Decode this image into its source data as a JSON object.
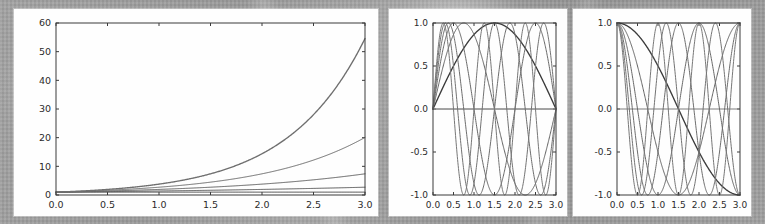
{
  "figure": {
    "title": "",
    "background_color": "#9a9a9a",
    "panel_background": "#fefefe",
    "panel_count": 3
  },
  "panels": [
    {
      "name": "exponential-curves",
      "position": "left"
    },
    {
      "name": "sine-curves",
      "position": "center"
    },
    {
      "name": "cosine-curves",
      "position": "right"
    }
  ],
  "chart_data": [
    {
      "type": "line",
      "name": "exponential-curves",
      "title": "",
      "xlabel": "",
      "ylabel": "",
      "xlim": [
        0.0,
        3.0
      ],
      "ylim": [
        0,
        60
      ],
      "grid": false,
      "legend": "none",
      "xticks": [
        0.0,
        0.5,
        1.0,
        1.5,
        2.0,
        2.5,
        3.0
      ],
      "xticklabels": [
        "0.0",
        "0.5",
        "1.0",
        "1.5",
        "2.0",
        "2.5",
        "3.0"
      ],
      "yticks": [
        0,
        10,
        20,
        30,
        40,
        50,
        60
      ],
      "yticklabels": [
        "0",
        "10",
        "20",
        "30",
        "40",
        "50",
        "60"
      ],
      "x": [
        0.0,
        0.25,
        0.5,
        0.75,
        1.0,
        1.25,
        1.5,
        1.75,
        2.0,
        2.25,
        2.5,
        2.75,
        3.0
      ],
      "series": [
        {
          "name": "exp(0x)",
          "rate": 0.0,
          "color": "#4a4a4a",
          "values": [
            1.0,
            1.0,
            1.0,
            1.0,
            1.0,
            1.0,
            1.0,
            1.0,
            1.0,
            1.0,
            1.0,
            1.0,
            1.0
          ]
        },
        {
          "name": "exp(x/3)",
          "rate": 0.3333,
          "color": "#555555",
          "values": [
            1.0,
            1.09,
            1.18,
            1.28,
            1.4,
            1.52,
            1.65,
            1.79,
            1.95,
            2.12,
            2.3,
            2.5,
            2.72
          ]
        },
        {
          "name": "exp(2x/3)",
          "rate": 0.6667,
          "color": "#5f5f5f",
          "values": [
            1.0,
            1.18,
            1.4,
            1.65,
            1.95,
            2.3,
            2.72,
            3.21,
            3.79,
            4.48,
            5.29,
            6.25,
            7.39
          ]
        },
        {
          "name": "exp(x)",
          "rate": 1.0,
          "color": "#6a6a6a",
          "values": [
            1.0,
            1.28,
            1.65,
            2.12,
            2.72,
            3.49,
            4.48,
            5.75,
            7.39,
            9.49,
            12.18,
            15.64,
            20.09
          ]
        },
        {
          "name": "exp(4x/3)",
          "rate": 1.3333,
          "color": "#6f6f6f",
          "values": [
            1.0,
            1.4,
            1.95,
            2.72,
            3.79,
            5.29,
            7.39,
            10.31,
            14.39,
            20.09,
            28.03,
            39.12,
            54.6
          ]
        }
      ]
    },
    {
      "type": "line",
      "name": "sine-curves",
      "title": "",
      "xlabel": "",
      "ylabel": "",
      "xlim": [
        0.0,
        3.0
      ],
      "ylim": [
        -1.0,
        1.0
      ],
      "grid": false,
      "legend": "none",
      "xticks": [
        0.0,
        0.5,
        1.0,
        1.5,
        2.0,
        2.5,
        3.0
      ],
      "xticklabels": [
        "0.0",
        "0.5",
        "1.0",
        "1.5",
        "2.0",
        "2.5",
        "3.0"
      ],
      "yticks": [
        -1.0,
        -0.5,
        0.0,
        0.5,
        1.0
      ],
      "yticklabels": [
        "-1.0",
        "-0.5",
        "0.0",
        "0.5",
        "1.0"
      ],
      "function": "sin(k*pi*x/3)",
      "series": [
        {
          "name": "sin(0)",
          "k": 0,
          "color": "#808080"
        },
        {
          "name": "sin(pi*x/3)",
          "k": 1,
          "color": "#3c3c3c"
        },
        {
          "name": "sin(2pi*x/3)",
          "k": 2,
          "color": "#626262"
        },
        {
          "name": "sin(3pi*x/3)",
          "k": 3,
          "color": "#686868"
        },
        {
          "name": "sin(4pi*x/3)",
          "k": 4,
          "color": "#6d6d6d"
        },
        {
          "name": "sin(5pi*x/3)",
          "k": 5,
          "color": "#737373"
        },
        {
          "name": "sin(6pi*x/3)",
          "k": 6,
          "color": "#777777"
        }
      ]
    },
    {
      "type": "line",
      "name": "cosine-curves",
      "title": "",
      "xlabel": "",
      "ylabel": "",
      "xlim": [
        0.0,
        3.0
      ],
      "ylim": [
        -1.0,
        1.0
      ],
      "grid": false,
      "legend": "none",
      "xticks": [
        0.0,
        0.5,
        1.0,
        1.5,
        2.0,
        2.5,
        3.0
      ],
      "xticklabels": [
        "0.0",
        "0.5",
        "1.0",
        "1.5",
        "2.0",
        "2.5",
        "3.0"
      ],
      "yticks": [
        -1.0,
        -0.5,
        0.0,
        0.5,
        1.0
      ],
      "yticklabels": [
        "-1.0",
        "-0.5",
        "0.0",
        "0.5",
        "1.0"
      ],
      "function": "cos(k*pi*x/3)",
      "series": [
        {
          "name": "cos(0)",
          "k": 0,
          "color": "#808080"
        },
        {
          "name": "cos(pi*x/3)",
          "k": 1,
          "color": "#3c3c3c"
        },
        {
          "name": "cos(2pi*x/3)",
          "k": 2,
          "color": "#626262"
        },
        {
          "name": "cos(3pi*x/3)",
          "k": 3,
          "color": "#686868"
        },
        {
          "name": "cos(4pi*x/3)",
          "k": 4,
          "color": "#6d6d6d"
        },
        {
          "name": "cos(5pi*x/3)",
          "k": 5,
          "color": "#737373"
        },
        {
          "name": "cos(6pi*x/3)",
          "k": 6,
          "color": "#777777"
        }
      ]
    }
  ]
}
